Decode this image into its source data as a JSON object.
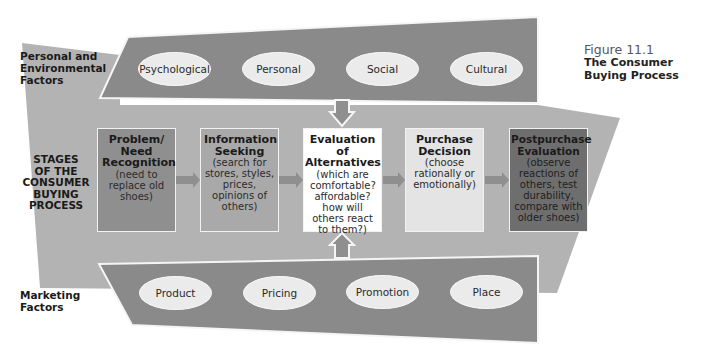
{
  "figure": {
    "number": "Figure 11.1",
    "caption": "The Consumer Buying Process"
  },
  "labels": {
    "personal_env": [
      "Personal and",
      "Environmental",
      "Factors"
    ],
    "stages": [
      "STAGES",
      "OF THE",
      "CONSUMER",
      "BUYING",
      "PROCESS"
    ],
    "marketing": [
      "Marketing",
      "Factors"
    ]
  },
  "personal_factors": [
    {
      "label": "Psychological"
    },
    {
      "label": "Personal"
    },
    {
      "label": "Social"
    },
    {
      "label": "Cultural"
    }
  ],
  "stages": [
    {
      "title": "Problem/ Need Recognition",
      "desc": "(need to replace old shoes)",
      "fill": "#8f8f8f"
    },
    {
      "title": "Information Seeking",
      "desc": "(search for stores, styles, prices, opinions of others)",
      "fill": "#a9a9a9"
    },
    {
      "title": "Evaluation of Alternatives",
      "desc": "(which are comfortable? affordable? how will others react to them?)",
      "fill": "#ffffff"
    },
    {
      "title": "Purchase Decision",
      "desc": "(choose rationally or emotionally)",
      "fill": "#e4e4e4"
    },
    {
      "title": "Postpurchase Evaluation",
      "desc": "(observe reactions of others, test durability, compare with older shoes)",
      "fill": "#6e6e6e"
    }
  ],
  "marketing_factors": [
    {
      "label": "Product"
    },
    {
      "label": "Pricing"
    },
    {
      "label": "Promotion"
    },
    {
      "label": "Place"
    }
  ],
  "colors": {
    "band_dark": "#8a8a8a",
    "band_light": "#b3b3b3",
    "arrow": "#8f8f8f",
    "outline": "#f5f5f5"
  }
}
